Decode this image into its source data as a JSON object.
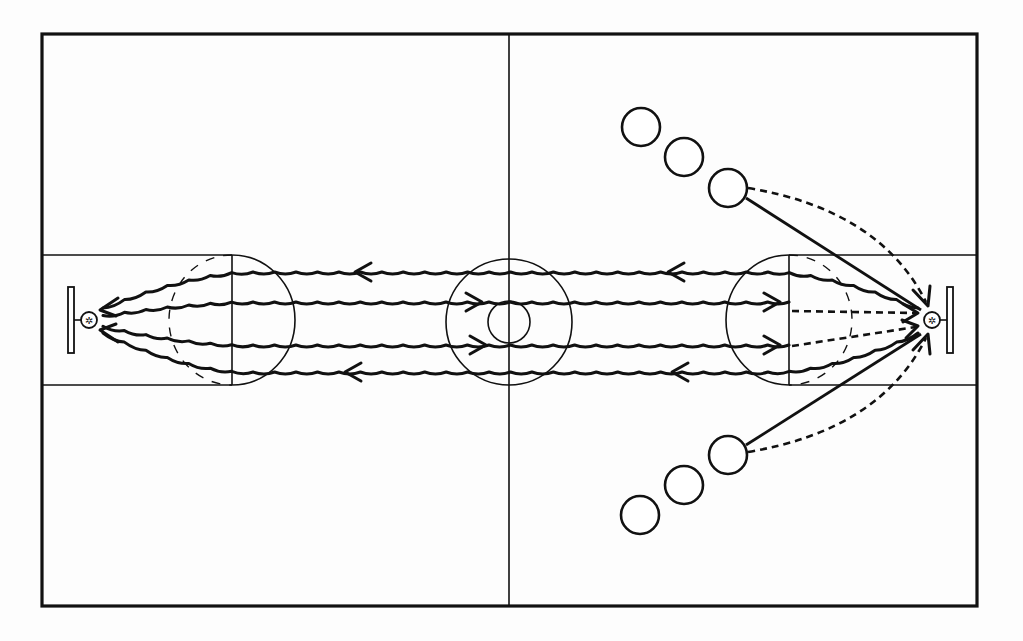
{
  "diagram": {
    "court": {
      "border": {
        "x1": 42,
        "y1": 34,
        "x2": 977,
        "y2": 606
      },
      "half_court_x": 509,
      "lane": {
        "top": 255,
        "bottom": 385
      },
      "left_free_throw_x": 232,
      "right_free_throw_x": 789,
      "free_throw_radius": 62,
      "center_circle": {
        "cx": 509,
        "cy": 322,
        "r_outer": 63,
        "r_inner": 21
      }
    },
    "baskets": [
      {
        "side": "left",
        "backboard_x": 68,
        "hoop_cx": 89,
        "hoop_cy": 320,
        "hoop_r": 8
      },
      {
        "side": "right",
        "backboard_x": 947,
        "hoop_cx": 932,
        "hoop_cy": 320,
        "hoop_r": 8
      }
    ],
    "dribble_lanes": [
      {
        "y": 272,
        "direction": "left",
        "arrow_x": [
          355,
          668
        ]
      },
      {
        "y": 302,
        "direction": "right",
        "arrow_x": [
          482,
          780
        ]
      },
      {
        "y": 345,
        "direction": "right",
        "arrow_x": [
          486,
          780
        ]
      },
      {
        "y": 372,
        "direction": "left",
        "arrow_x": [
          345,
          672
        ]
      }
    ],
    "players": {
      "top_wing": [
        {
          "cx": 641,
          "cy": 127
        },
        {
          "cx": 684,
          "cy": 157
        },
        {
          "cx": 728,
          "cy": 188
        }
      ],
      "bottom_wing": [
        {
          "cx": 640,
          "cy": 515
        },
        {
          "cx": 684,
          "cy": 485
        },
        {
          "cx": 728,
          "cy": 455
        }
      ],
      "radius": 19
    },
    "legend_symbols": {
      "wavy_line": "dribble",
      "dashed_line": "pass",
      "solid_line": "cut",
      "circle": "player",
      "hoop": "basket"
    },
    "colors": {
      "ink": "#111111",
      "paper": "#fdfdfd"
    }
  }
}
